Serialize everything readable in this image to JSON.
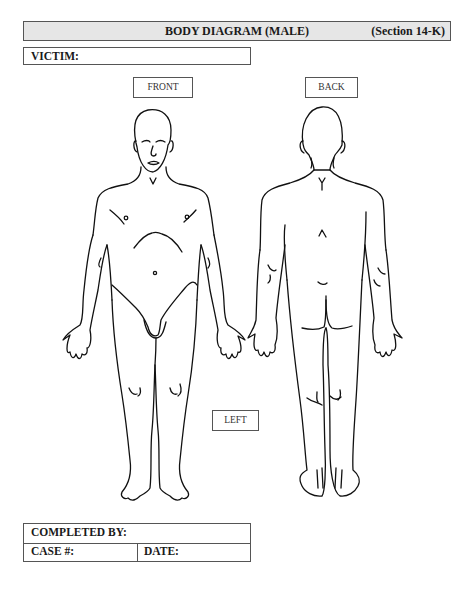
{
  "header": {
    "title": "BODY DIAGRAM (MALE)",
    "section": "(Section 14-K)",
    "background_color": "#e6e6e6"
  },
  "victim": {
    "label": "VICTIM:",
    "value": ""
  },
  "views": {
    "front_label": "FRONT",
    "back_label": "BACK",
    "side_label": "LEFT"
  },
  "footer": {
    "completed_by_label": "COMPLETED BY:",
    "completed_by_value": "",
    "case_label": "CASE #:",
    "case_value": "",
    "date_label": "DATE:",
    "date_value": ""
  },
  "figures": {
    "front": "front-body-outline",
    "back": "back-body-outline"
  }
}
